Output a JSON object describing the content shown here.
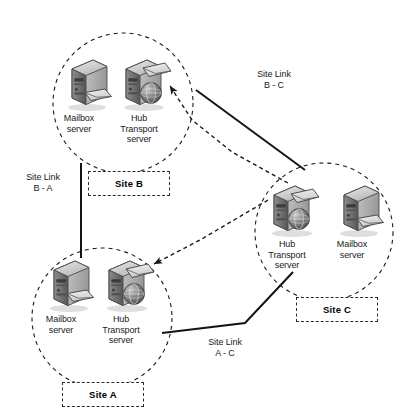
{
  "diagram": {
    "type": "network-topology",
    "background_color": "#ffffff",
    "line_color": "#1a1a1a",
    "circle_style": "dashed",
    "sites": [
      {
        "id": "site-b",
        "label": "Site B",
        "circle": {
          "cx": 123,
          "cy": 103,
          "r": 70
        },
        "box": {
          "x": 88,
          "y": 171,
          "w": 80,
          "h": 23
        },
        "servers": [
          {
            "id": "site-b-mailbox",
            "role": "Mailbox server",
            "icon": "mailbox-server-icon",
            "label": "Mailbox\nserver",
            "icon_x": 62,
            "icon_y": 57,
            "label_x": 55,
            "label_y": 112
          },
          {
            "id": "site-b-hub",
            "role": "Hub Transport server",
            "icon": "hub-transport-server-icon",
            "label": "Hub\nTransport\nserver",
            "icon_x": 120,
            "icon_y": 57,
            "label_x": 113,
            "label_y": 112
          }
        ]
      },
      {
        "id": "site-c",
        "label": "Site C",
        "circle": {
          "cx": 324,
          "cy": 232,
          "r": 69
        },
        "box": {
          "x": 296,
          "y": 297,
          "w": 80,
          "h": 23
        },
        "servers": [
          {
            "id": "site-c-hub",
            "role": "Hub Transport server",
            "icon": "hub-transport-server-icon",
            "label": "Hub\nTransport\nserver",
            "icon_x": 268,
            "icon_y": 183,
            "label_x": 261,
            "label_y": 238
          },
          {
            "id": "site-c-mailbox",
            "role": "Mailbox server",
            "icon": "mailbox-server-icon",
            "label": "Mailbox\nserver",
            "icon_x": 334,
            "icon_y": 183,
            "label_x": 327,
            "label_y": 238
          }
        ]
      },
      {
        "id": "site-a",
        "label": "Site A",
        "circle": {
          "cx": 102,
          "cy": 318,
          "r": 70
        },
        "box": {
          "x": 62,
          "y": 382,
          "w": 80,
          "h": 23
        },
        "servers": [
          {
            "id": "site-a-mailbox",
            "role": "Mailbox server",
            "icon": "mailbox-server-icon",
            "label": "Mailbox\nserver",
            "icon_x": 44,
            "icon_y": 258,
            "label_x": 37,
            "label_y": 313
          },
          {
            "id": "site-a-hub",
            "role": "Hub Transport server",
            "icon": "hub-transport-server-icon",
            "label": "Hub\nTransport\nserver",
            "icon_x": 103,
            "icon_y": 258,
            "label_x": 96,
            "label_y": 313
          }
        ]
      }
    ],
    "site_links": [
      {
        "id": "link-b-c",
        "label": "Site Link\nB - C",
        "style": "solid",
        "from": "site-b",
        "to": "site-c",
        "label_x": 246,
        "label_y": 68,
        "path": "M 196 90 L 305 170"
      },
      {
        "id": "link-b-a",
        "label": "Site Link\nB - A",
        "style": "solid",
        "from": "site-b",
        "to": "site-a",
        "label_x": 14,
        "label_y": 172,
        "path": "M 81 163 L 81 258"
      },
      {
        "id": "link-a-c",
        "label": "Site Link\nA - C",
        "style": "solid",
        "from": "site-a",
        "to": "site-c",
        "label_x": 196,
        "label_y": 337,
        "path": "M 162 333 L 245 323 L 293 272"
      }
    ],
    "mail_flows": [
      {
        "id": "flow-c-to-b",
        "style": "dashed-arrow",
        "from": "site-c-hub",
        "to": "site-b-hub",
        "path": "M 286 182 L 230 152 L 190 120 L 168 85"
      },
      {
        "id": "flow-c-to-a",
        "style": "dashed-arrow",
        "from": "site-c-hub",
        "to": "site-a-hub",
        "path": "M 268 201 L 200 240 L 152 263"
      }
    ]
  }
}
